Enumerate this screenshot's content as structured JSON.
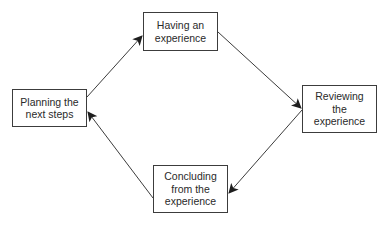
{
  "diagram": {
    "type": "cycle",
    "colors": {
      "stroke": "#3c3c3c",
      "text": "#2a2a2a",
      "background": "#ffffff"
    },
    "nodes": [
      {
        "id": "having",
        "label": "Having an\nexperience"
      },
      {
        "id": "reviewing",
        "label": "Reviewing\nthe\nexperience"
      },
      {
        "id": "concluding",
        "label": "Concluding\nfrom the\nexperience"
      },
      {
        "id": "planning",
        "label": "Planning the\nnext steps"
      }
    ],
    "edges": [
      {
        "from": "planning",
        "to": "having"
      },
      {
        "from": "having",
        "to": "reviewing"
      },
      {
        "from": "reviewing",
        "to": "concluding"
      },
      {
        "from": "concluding",
        "to": "planning"
      }
    ]
  }
}
